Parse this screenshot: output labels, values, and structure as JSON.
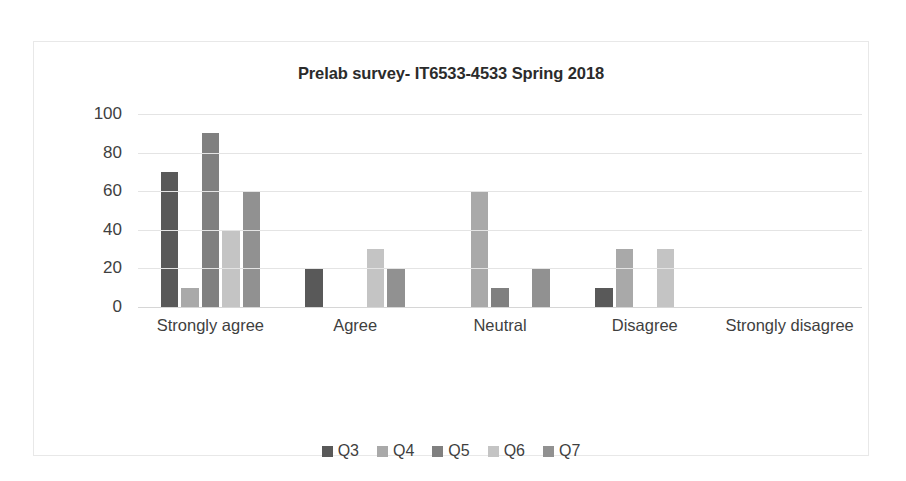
{
  "chart_data": {
    "type": "bar",
    "title": "Prelab survey- IT6533-4533 Spring 2018",
    "xlabel": "",
    "ylabel": "",
    "ylim": [
      0,
      100
    ],
    "yticks": [
      100,
      80,
      60,
      40,
      20,
      0
    ],
    "grid": true,
    "legend_position": "bottom",
    "categories": [
      "Strongly agree",
      "Agree",
      "Neutral",
      "Disagree",
      "Strongly disagree"
    ],
    "series": [
      {
        "name": "Q3",
        "color": "#595959",
        "values": [
          70,
          20,
          0,
          10,
          0
        ]
      },
      {
        "name": "Q4",
        "color": "#a9a9a9",
        "values": [
          10,
          0,
          60,
          30,
          0
        ]
      },
      {
        "name": "Q5",
        "color": "#808080",
        "values": [
          90,
          0,
          10,
          0,
          0
        ]
      },
      {
        "name": "Q6",
        "color": "#c4c4c4",
        "values": [
          40,
          30,
          0,
          30,
          0
        ]
      },
      {
        "name": "Q7",
        "color": "#919191",
        "values": [
          60,
          20,
          20,
          0,
          0
        ]
      }
    ]
  },
  "colors": {
    "frame_border": "#e8e8e8",
    "gridline": "#e4e4e4",
    "axis": "#d6d6d6",
    "title_text": "#2b2b2b",
    "tick_text": "#3f3f3f",
    "background": "#ffffff"
  }
}
